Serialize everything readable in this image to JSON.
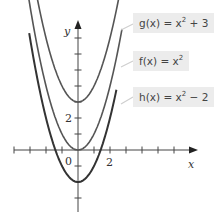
{
  "chart_data": {
    "type": "line",
    "title": "",
    "xlabel": "x",
    "ylabel": "y",
    "x_tick_labels": [
      "0",
      "2"
    ],
    "y_tick_labels": [
      "2"
    ],
    "xlim": [
      -4,
      7.5
    ],
    "ylim": [
      -4,
      8
    ],
    "grid": false,
    "legend_position": "right (callout boxes)",
    "series": [
      {
        "name": "g(x) = x^2 + 3",
        "label_base": "g(x) = x",
        "label_exp": "2",
        "label_tail": " + 3",
        "expression": "x^2 + 3",
        "vertex": [
          0,
          3
        ]
      },
      {
        "name": "f(x) = x^2",
        "label_base": "f(x) = x",
        "label_exp": "2",
        "label_tail": "",
        "expression": "x^2",
        "vertex": [
          0,
          0
        ]
      },
      {
        "name": "h(x) = x^2 - 2",
        "label_base": "h(x) = x",
        "label_exp": "2",
        "label_tail": " − 2",
        "expression": "x^2 - 2",
        "vertex": [
          0,
          -2
        ]
      }
    ]
  },
  "axes": {
    "x_label": "x",
    "y_label": "y",
    "origin_label": "0",
    "x_tick_2": "2",
    "y_tick_2": "2"
  }
}
